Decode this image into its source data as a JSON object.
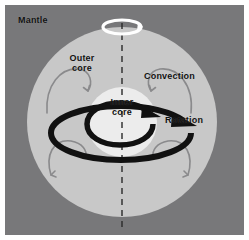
{
  "figure": {
    "width": 249,
    "height": 240
  },
  "colors": {
    "background": "#ffffff",
    "mantle": "#78787a",
    "outer_core": "#c8c8c8",
    "inner_core": "#ececec",
    "label_text": "#111111",
    "rotation_arrow": "#111111",
    "convection_arrow": "#8a8a8c",
    "spin_arrow": "#ffffff",
    "axis_dash": "#2a2a2a"
  },
  "labels": {
    "mantle": "Mantle",
    "outer_core_line1": "Outer",
    "outer_core_line2": "core",
    "inner_core_line1": "Inner",
    "inner_core_line2": "core",
    "convection": "Convection",
    "rotation": "Rotation"
  },
  "layers": [
    {
      "name": "mantle",
      "shape": "background-field",
      "color": "#78787a"
    },
    {
      "name": "outer-core",
      "shape": "circle",
      "cx": 117,
      "cy": 117,
      "r": 95,
      "color": "#c8c8c8"
    },
    {
      "name": "inner-core",
      "shape": "circle",
      "cx": 117,
      "cy": 117,
      "r": 35,
      "color": "#ececec"
    }
  ],
  "annotations": {
    "rotation_axis": {
      "name": "rotation-axis",
      "style": "dashed-vertical",
      "x": 117
    },
    "spin_indicator": {
      "name": "spin-arrow",
      "position": "top-of-axis",
      "direction": "counterclockwise-viewed-from-above"
    },
    "rotation_arrows": {
      "count": 2,
      "direction": "eastward",
      "style": "thick-elliptical-spiral"
    },
    "convection_cells": {
      "count": 4,
      "style": "thin-curved-arrows",
      "sides": [
        "left-upper",
        "left-lower",
        "right-upper",
        "right-lower"
      ]
    }
  }
}
